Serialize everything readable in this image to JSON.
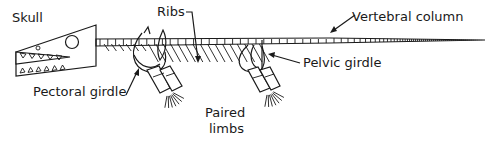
{
  "diagram": {
    "labels": {
      "skull": "Skull",
      "ribs": "Ribs",
      "vertebral_column": "Vertebral column",
      "pelvic_girdle": "Pelvic girdle",
      "pectoral_girdle": "Pectoral girdle",
      "paired_limbs_line1": "Paired",
      "paired_limbs_line2": "limbs"
    },
    "colors": {
      "ink": "#1a1a1a",
      "background": "#ffffff"
    }
  }
}
